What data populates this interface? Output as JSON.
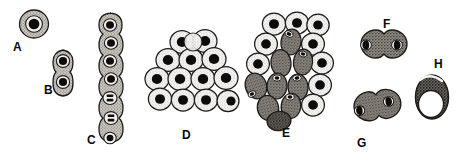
{
  "figure": {
    "type": "scientific-illustration",
    "width": 463,
    "height": 163,
    "background_color": "#ffffff",
    "ink_color": "#1a1a1a",
    "rendering_style": "black-and-white stippled line drawing, scanned halftone"
  },
  "palette": {
    "outline": "#1a1a1a",
    "nucleus_dark": "#0d0d0d",
    "cytoplasm_light": "#f2f2f2",
    "cytoplasm_mid": "#b8b4ae",
    "cytoplasm_dark": "#8a8580",
    "vacuole_white": "#ffffff",
    "label_text": "#0a0a0a"
  },
  "labels": [
    {
      "id": "A",
      "text": "A",
      "x": 13,
      "y": 41
    },
    {
      "id": "B",
      "text": "B",
      "x": 44,
      "y": 84
    },
    {
      "id": "C",
      "text": "C",
      "x": 87,
      "y": 134
    },
    {
      "id": "D",
      "text": "D",
      "x": 182,
      "y": 129
    },
    {
      "id": "E",
      "text": "E",
      "x": 282,
      "y": 127
    },
    {
      "id": "F",
      "text": "F",
      "x": 383,
      "y": 18
    },
    {
      "id": "G",
      "text": "G",
      "x": 357,
      "y": 137
    },
    {
      "id": "H",
      "text": "H",
      "x": 434,
      "y": 58
    }
  ],
  "panels": [
    {
      "id": "A",
      "name": "single-cell",
      "description": "Single round cell with gray stippled cytoplasm ring and large dark round nucleus",
      "cell_count": 1,
      "center": {
        "x": 34,
        "y": 24
      },
      "shading": "cytoplasm_mid"
    },
    {
      "id": "B",
      "name": "two-cell-chain",
      "description": "Vertical chain of two attached cells, each with a dark nucleus",
      "cell_count": 2,
      "center": {
        "x": 63,
        "y": 68
      },
      "shading": "cytoplasm_mid"
    },
    {
      "id": "C",
      "name": "multicell-chain",
      "description": "Vertical filament chain of seven cells; lower cells show divided bar-shaped nuclei",
      "cell_count": 7,
      "center": {
        "x": 110,
        "y": 75
      },
      "shading": "cytoplasm_mid"
    },
    {
      "id": "D",
      "name": "light-cell-cluster",
      "description": "Triangular packed cluster of fifteen light stippled cells, each with a dark round nucleus",
      "cell_count": 15,
      "center": {
        "x": 192,
        "y": 75
      },
      "shading": "cytoplasm_light"
    },
    {
      "id": "E",
      "name": "mixed-cell-cluster",
      "description": "Irregular cluster mixing light stippled cells and darker gray elongated cells",
      "cell_count": 17,
      "center": {
        "x": 286,
        "y": 70
      },
      "shading": "cytoplasm_light and cytoplasm_dark"
    },
    {
      "id": "F",
      "name": "dumbbell-pair-horizontal",
      "description": "Horizontal figure-eight dumbbell of two fusing cells with dark nuclei at outer ends",
      "cell_count": 2,
      "center": {
        "x": 378,
        "y": 44
      },
      "shading": "cytoplasm_dark"
    },
    {
      "id": "G",
      "name": "dumbbell-pair-tilted",
      "description": "Tilted dumbbell of two fusing cells with dark crescent nuclei at outer edges",
      "cell_count": 2,
      "center": {
        "x": 371,
        "y": 106
      },
      "shading": "cytoplasm_dark"
    },
    {
      "id": "H",
      "name": "vacuolated-cell",
      "description": "Upright oval cell with dark granular body and a large clear white vacuole",
      "cell_count": 1,
      "center": {
        "x": 432,
        "y": 97
      },
      "shading": "cytoplasm_dark with vacuole_white"
    }
  ]
}
